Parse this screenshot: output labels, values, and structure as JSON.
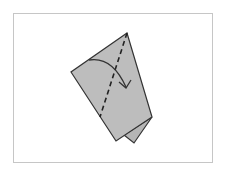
{
  "diagram": {
    "type": "origami-fold-step",
    "colors": {
      "background": "#ffffff",
      "frame_border": "#c6c6c6",
      "paper_fill": "#bdbdbd",
      "paper_back_fill": "#b5b5b5",
      "outline": "#333333",
      "fold_line": "#222222",
      "arrow": "#333333"
    },
    "frame": {
      "x": 13,
      "y": 13,
      "width": 200,
      "height": 150
    },
    "paper_front": {
      "points": [
        [
          127,
          33
        ],
        [
          71,
          72
        ],
        [
          116,
          141
        ],
        [
          152,
          117
        ]
      ]
    },
    "paper_back_layer": {
      "points": [
        [
          152,
          117
        ],
        [
          124,
          135
        ],
        [
          134,
          143
        ]
      ]
    },
    "fold_line": {
      "style": "dashed",
      "from": [
        127,
        33
      ],
      "to": [
        100,
        117
      ]
    },
    "fold_arrow": {
      "start": [
        89,
        60
      ],
      "control": [
        112,
        56
      ],
      "end": [
        126,
        87
      ],
      "direction": "clockwise, left to right"
    }
  }
}
